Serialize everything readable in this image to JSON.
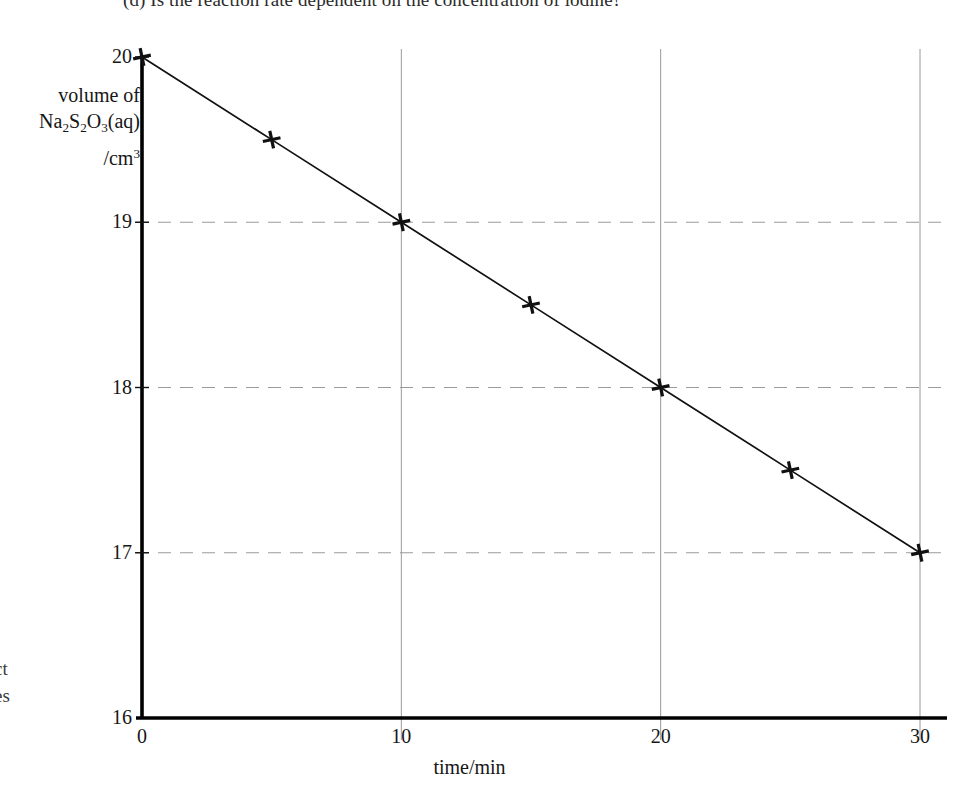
{
  "page": {
    "question_line": "(d) Is the reaction rate dependent on the concentration of iodine?",
    "margin_fragment_1": "ct",
    "margin_fragment_2": "es"
  },
  "chart_data": {
    "type": "line",
    "title": "",
    "xlabel": "time/min",
    "ylabel_lines": [
      "volume of",
      "Na2S2O3(aq)",
      "/cm3"
    ],
    "ylabel_plain": "volume of Na2S2O3(aq) /cm3",
    "x": [
      0,
      5,
      10,
      15,
      20,
      25,
      30
    ],
    "values": [
      20,
      19.5,
      19,
      18.5,
      18,
      17.5,
      17
    ],
    "xlim": [
      0,
      30
    ],
    "ylim": [
      16,
      20
    ],
    "xticks": [
      0,
      10,
      20,
      30
    ],
    "xtick_labels": [
      "0",
      "10",
      "20",
      "30"
    ],
    "yticks": [
      16,
      17,
      18,
      19,
      20
    ],
    "ytick_labels": [
      "16",
      "17",
      "18",
      "19",
      "20"
    ],
    "grid": {
      "horizontal": "dashed",
      "vertical": "solid",
      "horizontal_at": [
        17,
        18,
        19
      ],
      "vertical_at": [
        10,
        20,
        30
      ]
    },
    "marker": "cross",
    "legend": "none",
    "series_color": "#111111",
    "grid_color": "#9a9a9a",
    "axis_color": "#000000"
  },
  "ylabel_parts": {
    "line1": "volume of",
    "na": "Na",
    "sub1": "2",
    "s": "S",
    "sub2": "2",
    "o": "O",
    "sub3": "3",
    "aq": "(aq)",
    "cm": "/cm",
    "sup3": "3"
  }
}
